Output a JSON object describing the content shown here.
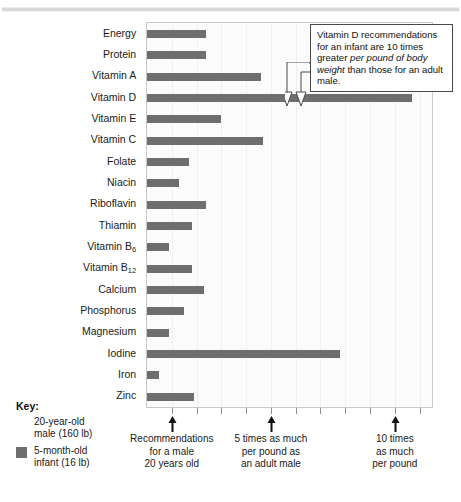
{
  "figure": {
    "top_rule": "horizontal-rule"
  },
  "callout": {
    "part1": "Vitamin D recommendations for an infant are 10 times greater ",
    "emphasis": "per pound of body weight",
    "part2": " than those for an adult male."
  },
  "key": {
    "title": "Key:",
    "items": [
      {
        "label_line1": "20-year-old",
        "label_line2": "male (160 lb)",
        "swatch": "none"
      },
      {
        "label_line1": "5-month-old",
        "label_line2": "infant (16 lb)",
        "swatch": "#6e6e6e"
      }
    ]
  },
  "axis_captions": [
    {
      "line1": "Recommendations",
      "line2": "for a male",
      "line3": "20 years old",
      "value": 1
    },
    {
      "line1": "5 times as much",
      "line2": "per pound as",
      "line3": "an adult male",
      "value": 5
    },
    {
      "line1": "10 times",
      "line2": "as much",
      "line3": "per pound",
      "value": 10
    }
  ],
  "chart_data": {
    "type": "bar",
    "orientation": "horizontal",
    "title": "",
    "xlabel": "Recommendations per pound of body weight, relative to an adult male",
    "ylabel": "",
    "xlim": [
      0,
      11.5
    ],
    "xticks": [
      1,
      2,
      3,
      4,
      5,
      6,
      7,
      8,
      9,
      10,
      11
    ],
    "labeled_xticks": [
      1,
      5,
      10
    ],
    "grid": true,
    "legend_position": "bottom-left",
    "series_name": "5-month-old infant (16 lb)",
    "bar_color": "#6e6e6e",
    "categories": [
      "Energy",
      "Protein",
      "Vitamin A",
      "Vitamin D",
      "Vitamin E",
      "Vitamin C",
      "Folate",
      "Niacin",
      "Riboflavin",
      "Thiamin",
      "Vitamin B6",
      "Vitamin B12",
      "Calcium",
      "Phosphorus",
      "Magnesium",
      "Iodine",
      "Iron",
      "Zinc"
    ],
    "category_labels_html": [
      "Energy",
      "Protein",
      "Vitamin A",
      "Vitamin D",
      "Vitamin E",
      "Vitamin C",
      "Folate",
      "Niacin",
      "Riboflavin",
      "Thiamin",
      "Vitamin B<sub>6</sub>",
      "Vitamin B<sub>12</sub>",
      "Calcium",
      "Phosphorus",
      "Magnesium",
      "Iodine",
      "Iron",
      "Zinc"
    ],
    "values": [
      2.4,
      2.4,
      4.6,
      10.7,
      3.0,
      4.7,
      1.7,
      1.3,
      2.4,
      1.8,
      0.9,
      1.8,
      2.3,
      1.5,
      0.9,
      7.8,
      0.5,
      1.9
    ]
  }
}
